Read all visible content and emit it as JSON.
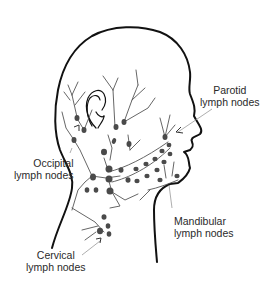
{
  "figure": {
    "colors": {
      "outline": "#111111",
      "vessel": "#555555",
      "node": "#4a4a4a",
      "pointer": "#999999",
      "text": "#2a2a2a",
      "background": "#ffffff"
    },
    "labels": [
      {
        "id": "parotid",
        "line1": "Parotid",
        "line2": "lymph nodes"
      },
      {
        "id": "occipital",
        "line1": "Occipital",
        "line2": "lymph nodes"
      },
      {
        "id": "mandibular",
        "line1": "Mandibular",
        "line2": "lymph nodes"
      },
      {
        "id": "cervical",
        "line1": "Cervical",
        "line2": "lymph nodes"
      }
    ]
  }
}
